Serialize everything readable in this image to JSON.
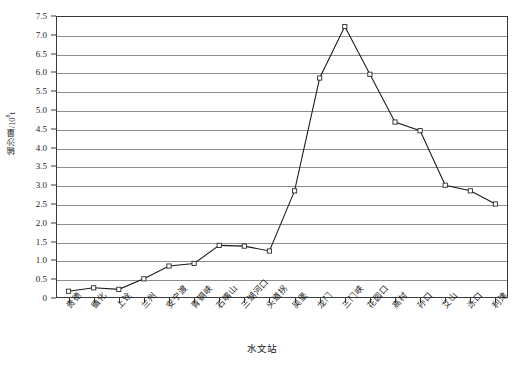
{
  "chart_data": {
    "type": "line",
    "title": "",
    "xlabel": "水文站",
    "ylabel": "输沙量/10⁸t",
    "ylabel_base": "输沙量/10",
    "ylabel_exp": "8",
    "ylabel_unit": "t",
    "ylim": [
      0,
      7.5
    ],
    "ystep": 0.5,
    "grid": true,
    "legend": "none",
    "categories": [
      "贵德",
      "循化",
      "上诠",
      "兰州",
      "安宁渡",
      "青铜峡",
      "石嘴山",
      "三湖河口",
      "头道拐",
      "吴堡",
      "龙门",
      "三门峡",
      "花园口",
      "高村",
      "孙口",
      "艾山",
      "泺口",
      "利津"
    ],
    "values": [
      0.18,
      0.27,
      0.23,
      0.51,
      0.85,
      0.92,
      1.4,
      1.38,
      1.25,
      2.85,
      5.85,
      7.22,
      5.95,
      4.68,
      4.45,
      3.0,
      2.85,
      2.5
    ],
    "ytick_labels": [
      "7.5",
      "7.0",
      "6.5",
      "6.0",
      "5.5",
      "5.0",
      "4.5",
      "4.0",
      "3.5",
      "3.0",
      "2.5",
      "2.0",
      "1.5",
      "1.0",
      "0.5",
      "0"
    ],
    "ytick_values": [
      7.5,
      7.0,
      6.5,
      6.0,
      5.5,
      5.0,
      4.5,
      4.0,
      3.5,
      3.0,
      2.5,
      2.0,
      1.5,
      1.0,
      0.5,
      0
    ],
    "series_name": "输沙量",
    "line_color": "#1a1a1a",
    "marker_color": "#ffffff",
    "grid_color": "#8d8d8d",
    "frame_color": "#3a3a3a"
  }
}
